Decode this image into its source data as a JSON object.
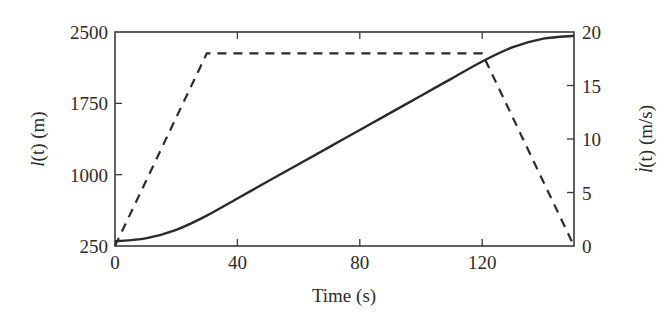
{
  "chart_data": {
    "type": "line",
    "title": "",
    "xlabel": "Time (s)",
    "ylabel": "l(t) (m)",
    "ylabel_right": "l̇(t) (m/s)",
    "xlim": [
      0,
      150
    ],
    "ylim": [
      250,
      2500
    ],
    "ylim_right": [
      0,
      20
    ],
    "x_ticks": [
      0,
      40,
      80,
      120
    ],
    "y_ticks": [
      250,
      1000,
      1750,
      2500
    ],
    "y_ticks_right": [
      0,
      5,
      10,
      15,
      20
    ],
    "grid": false,
    "legend": null,
    "series": [
      {
        "name": "l(t) position",
        "axis": "left",
        "style": "solid",
        "x": [
          0,
          10,
          20,
          30,
          40,
          50,
          60,
          70,
          80,
          90,
          100,
          110,
          120,
          130,
          140,
          150
        ],
        "values": [
          300,
          330,
          420,
          570,
          750,
          930,
          1110,
          1290,
          1470,
          1650,
          1830,
          2010,
          2190,
          2340,
          2430,
          2460
        ]
      },
      {
        "name": "l̇(t) velocity",
        "axis": "right",
        "style": "dashed",
        "x": [
          0,
          30,
          120,
          150
        ],
        "values": [
          0,
          18,
          18,
          0
        ]
      }
    ]
  },
  "labels": {
    "xlabel": "Time (s)",
    "ylabel_left_var": "l",
    "ylabel_left_arg": "(t)",
    "ylabel_left_unit": " (m)",
    "ylabel_right_var": "l̇",
    "ylabel_right_arg": "(t)",
    "ylabel_right_unit": " (m/s)"
  }
}
